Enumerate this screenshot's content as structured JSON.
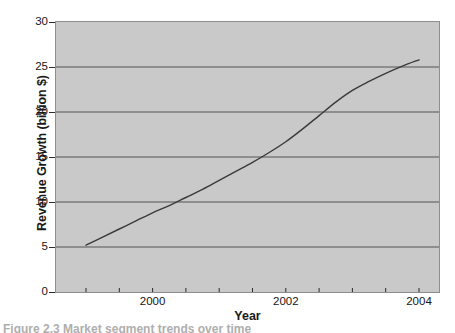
{
  "chart_data": {
    "type": "line",
    "title": "",
    "xlabel": "Year",
    "ylabel": "Revenue Growth (billion $)",
    "xlim": [
      1998.55,
      2004.3
    ],
    "ylim": [
      0,
      30
    ],
    "grid": "horizontal",
    "legend": "none",
    "background_color": "#c9c9c9",
    "line_color": "#3a3a3a",
    "gridline_color": "#555555",
    "x_ticks_major": [
      2000,
      2002,
      2004
    ],
    "x_tick_labels": [
      "2000",
      "2002",
      "2004"
    ],
    "x_ticks_minor_count": 12,
    "y_ticks": [
      0,
      5,
      10,
      15,
      20,
      25,
      30
    ],
    "y_tick_labels": [
      "0",
      "5",
      "10",
      "15",
      "20",
      "25",
      "30"
    ],
    "x": [
      1999.0,
      1999.25,
      1999.5,
      1999.75,
      2000.0,
      2000.25,
      2000.5,
      2000.75,
      2001.0,
      2001.25,
      2001.5,
      2001.75,
      2002.0,
      2002.25,
      2002.5,
      2002.75,
      2003.0,
      2003.25,
      2003.5,
      2003.75,
      2004.0
    ],
    "values": [
      5.2,
      6.1,
      7.0,
      7.9,
      8.8,
      9.6,
      10.5,
      11.4,
      12.4,
      13.4,
      14.4,
      15.5,
      16.7,
      18.1,
      19.6,
      21.1,
      22.4,
      23.4,
      24.3,
      25.1,
      25.8
    ],
    "series": [
      {
        "name": "Revenue Growth",
        "values": [
          5.2,
          6.1,
          7.0,
          7.9,
          8.8,
          9.6,
          10.5,
          11.4,
          12.4,
          13.4,
          14.4,
          15.5,
          16.7,
          18.1,
          19.6,
          21.1,
          22.4,
          23.4,
          24.3,
          25.1,
          25.8
        ]
      }
    ],
    "annotations": []
  },
  "axes": {
    "y_title": "Revenue Growth (billion $)",
    "x_title": "Year",
    "y_tick_labels": [
      "30",
      "25",
      "20",
      "15",
      "10",
      "5",
      "0"
    ],
    "x_tick_labels": [
      "2000",
      "2002",
      "2004"
    ]
  },
  "caption": {
    "text": "Figure 2.3   Market segment trends over time"
  }
}
